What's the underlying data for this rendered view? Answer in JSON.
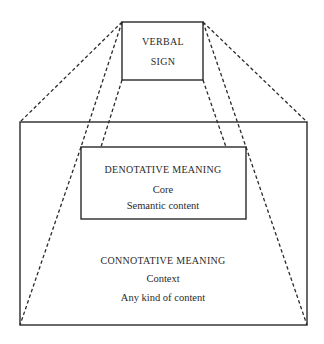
{
  "diagram": {
    "verbal_sign": {
      "line1": "VERBAL",
      "line2": "SIGN"
    },
    "denotative": {
      "title": "DENOTATIVE MEANING",
      "line1": "Core",
      "line2": "Semantic content"
    },
    "connotative": {
      "title": "CONNOTATIVE MEANING",
      "line1": "Context",
      "line2": "Any kind of content"
    },
    "colors": {
      "stroke": "#2a2a2a",
      "background": "#ffffff"
    }
  }
}
